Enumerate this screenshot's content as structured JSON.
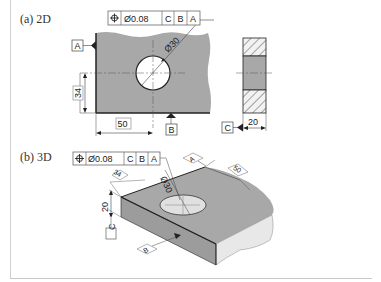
{
  "margin": {
    "text": "目次"
  },
  "panels": {
    "a": {
      "label": "(a) 2D"
    },
    "b": {
      "label": "(b) 3D"
    }
  },
  "fcf": {
    "symbol": "⌖",
    "tolerance": "Ø0.08",
    "datums": [
      "C",
      "B",
      "A"
    ]
  },
  "view2d": {
    "hole_diameter_label": "Ø30",
    "dim_vertical": "34",
    "dim_horizontal": "50",
    "datum_a": "A",
    "datum_b": "B"
  },
  "side_view": {
    "dim_thickness": "20",
    "datum_c": "C"
  },
  "view3d": {
    "hole_diameter_label": "Ø30",
    "dim_depth": "34",
    "dim_length": "50",
    "dim_thickness": "20",
    "datum_a": "A",
    "datum_b": "B",
    "datum_c": "C"
  },
  "colors": {
    "part_fill": "#a8a8a8",
    "part_side": "#e6e6e6",
    "line": "#222222"
  }
}
